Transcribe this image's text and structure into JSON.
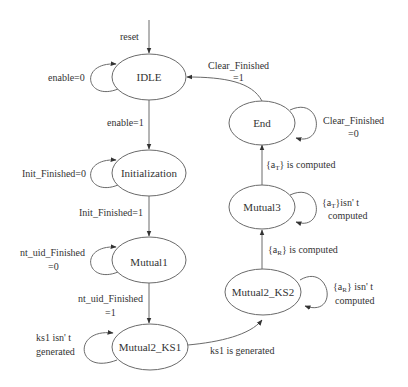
{
  "diagram": {
    "type": "state-machine",
    "states": [
      {
        "id": "idle",
        "label": "IDLE"
      },
      {
        "id": "init",
        "label": "Initialization"
      },
      {
        "id": "mutual1",
        "label": "Mutual1"
      },
      {
        "id": "mutual2_ks1",
        "label": "Mutual2_KS1"
      },
      {
        "id": "mutual2_ks2",
        "label": "Mutual2_KS2"
      },
      {
        "id": "mutual3",
        "label": "Mutual3"
      },
      {
        "id": "end",
        "label": "End"
      }
    ],
    "transitions": {
      "reset": {
        "from": "",
        "to": "idle",
        "label": "reset"
      },
      "idle_self": {
        "from": "idle",
        "to": "idle",
        "label": "enable=0"
      },
      "idle_init": {
        "from": "idle",
        "to": "init",
        "label": "enable=1"
      },
      "init_self": {
        "from": "init",
        "to": "init",
        "label": "Init_Finished=0"
      },
      "init_m1": {
        "from": "init",
        "to": "mutual1",
        "label": "Init_Finished=1"
      },
      "m1_self": {
        "from": "mutual1",
        "to": "mutual1",
        "label_line1": "nt_uid_Finished",
        "label_line2": "=0"
      },
      "m1_ks1": {
        "from": "mutual1",
        "to": "mutual2_ks1",
        "label_line1": "nt_uid_Finished",
        "label_line2": "=1"
      },
      "ks1_self": {
        "from": "mutual2_ks1",
        "to": "mutual2_ks1",
        "label_line1": "ks1 isn' t",
        "label_line2": "generated"
      },
      "ks1_ks2": {
        "from": "mutual2_ks1",
        "to": "mutual2_ks2",
        "label": "ks1 is generated"
      },
      "ks2_self": {
        "from": "mutual2_ks2",
        "to": "mutual2_ks2",
        "label_line1_prefix": "{a",
        "label_line1_sub": "R",
        "label_line1_suffix": "} isn' t",
        "label_line2": "computed"
      },
      "ks2_m3": {
        "from": "mutual2_ks2",
        "to": "mutual3",
        "label_prefix": "{a",
        "label_sub": "R",
        "label_suffix": "} is computed"
      },
      "m3_self": {
        "from": "mutual3",
        "to": "mutual3",
        "label_line1_prefix": "{a",
        "label_line1_sub": "T",
        "label_line1_suffix": "}isn' t",
        "label_line2": "computed"
      },
      "m3_end": {
        "from": "mutual3",
        "to": "end",
        "label_prefix": "{a",
        "label_sub": "T",
        "label_suffix": "} is computed"
      },
      "end_self": {
        "from": "end",
        "to": "end",
        "label_line1": "Clear_Finished",
        "label_line2": "=0"
      },
      "end_idle": {
        "from": "end",
        "to": "idle",
        "label_line1": "Clear_Finished",
        "label_line2": "=1"
      }
    },
    "colors": {
      "stroke": "#6a6a6a",
      "text": "#333333",
      "background": "#ffffff"
    }
  }
}
